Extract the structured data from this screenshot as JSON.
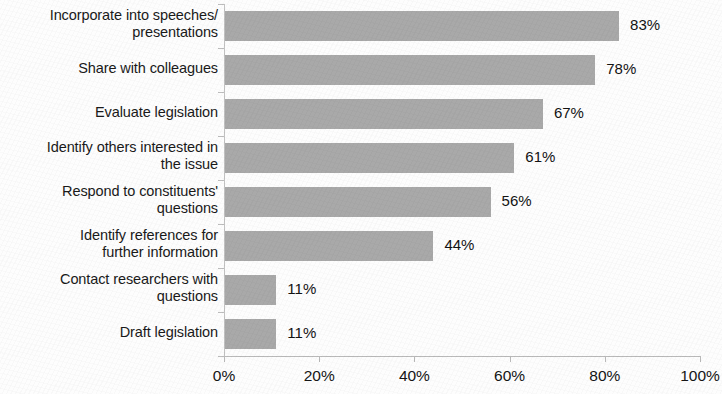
{
  "chart_data": {
    "type": "bar",
    "orientation": "horizontal",
    "title": "",
    "xlabel": "",
    "ylabel": "",
    "xlim": [
      0,
      100
    ],
    "grid": false,
    "legend": false,
    "value_suffix": "%",
    "bar_color": "#a9a9a9",
    "background_color": "#fdfdfd",
    "categories": [
      "Incorporate into speeches/\npresentations",
      "Share with colleagues",
      "Evaluate legislation",
      "Identify others interested in\nthe issue",
      "Respond to constituents'\nquestions",
      "Identify references for\nfurther information",
      "Contact researchers with\nquestions",
      "Draft legislation"
    ],
    "values": [
      83,
      78,
      67,
      61,
      56,
      44,
      11,
      11
    ],
    "data_labels": [
      "83%",
      "78%",
      "67%",
      "61%",
      "56%",
      "44%",
      "11%",
      "11%"
    ],
    "xticks": [
      0,
      20,
      40,
      60,
      80,
      100
    ],
    "xtick_labels": [
      "0%",
      "20%",
      "40%",
      "60%",
      "80%",
      "100%"
    ]
  }
}
